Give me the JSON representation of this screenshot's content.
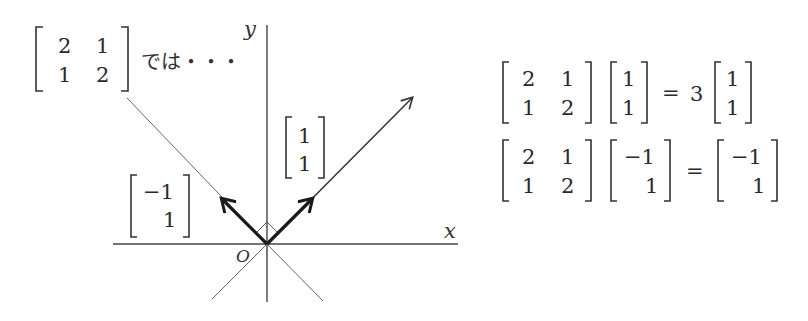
{
  "title_label": {
    "matrix": [
      [
        "2",
        "1"
      ],
      [
        "1",
        "2"
      ]
    ],
    "caption": "では・・・"
  },
  "axes": {
    "x_label": "x",
    "y_label": "y",
    "origin_label": "O"
  },
  "vectors": [
    {
      "name": "eigenvector-1",
      "components": [
        "1",
        "1"
      ],
      "direction": "up-right"
    },
    {
      "name": "eigenvector-2",
      "components": [
        "−1",
        "1"
      ],
      "direction": "up-left"
    }
  ],
  "equations": [
    {
      "matrix": [
        [
          "2",
          "1"
        ],
        [
          "1",
          "2"
        ]
      ],
      "vector": [
        "1",
        "1"
      ],
      "equals": "=",
      "scalar": "3",
      "result": [
        "1",
        "1"
      ]
    },
    {
      "matrix": [
        [
          "2",
          "1"
        ],
        [
          "1",
          "2"
        ]
      ],
      "vector": [
        "−1",
        "1"
      ],
      "equals": "=",
      "scalar": "",
      "result": [
        "−1",
        "1"
      ]
    }
  ],
  "colors": {
    "ink": "#2a2a2a",
    "thin_line": "#555555",
    "background": "#ffffff"
  }
}
